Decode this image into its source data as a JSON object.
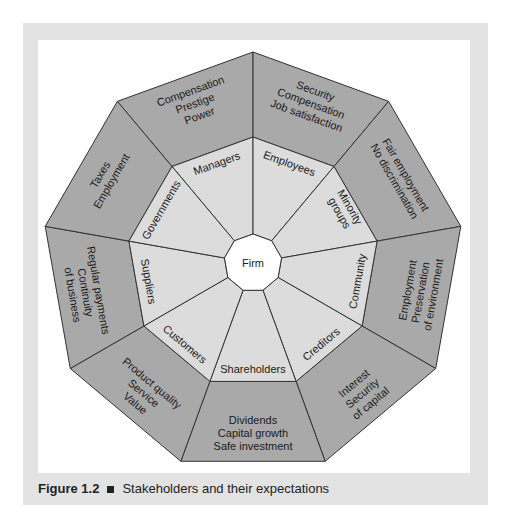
{
  "figure": {
    "center_label": "Firm",
    "caption_number": "Figure 1.2",
    "caption_text": "Stakeholders and their expectations",
    "colors": {
      "outer_ring": "#a9a9a9",
      "middle_ring": "#dcdcdc",
      "center": "#ffffff",
      "panel": "#e3e3e3",
      "stroke": "#333333"
    },
    "segments": [
      {
        "stakeholder": "Managers",
        "expectations": [
          "Compensation",
          "Prestige",
          "Power"
        ]
      },
      {
        "stakeholder": "Employees",
        "expectations": [
          "Security",
          "Compensation",
          "Job satisfaction"
        ]
      },
      {
        "stakeholder": "Minority groups",
        "expectations": [
          "Fair employment",
          "No discrimination"
        ]
      },
      {
        "stakeholder": "Community",
        "expectations": [
          "Employment",
          "Preservation",
          "of environment"
        ]
      },
      {
        "stakeholder": "Creditors",
        "expectations": [
          "Interest",
          "Security",
          "of capital"
        ]
      },
      {
        "stakeholder": "Shareholders",
        "expectations": [
          "Dividends",
          "Capital growth",
          "Safe investment"
        ]
      },
      {
        "stakeholder": "Customers",
        "expectations": [
          "Product quality",
          "Service",
          "Value"
        ]
      },
      {
        "stakeholder": "Suppliers",
        "expectations": [
          "Regular payments",
          "Continuity",
          "of business"
        ]
      },
      {
        "stakeholder": "Governments",
        "expectations": [
          "Taxes",
          "Employment"
        ]
      }
    ]
  }
}
